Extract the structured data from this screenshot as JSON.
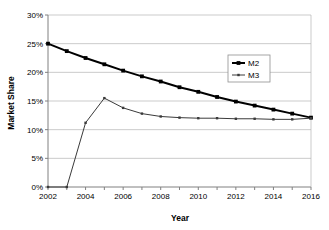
{
  "chart_data": {
    "type": "line",
    "title": "",
    "xlabel": "Year",
    "ylabel": "Market Share",
    "x": [
      2002,
      2003,
      2004,
      2005,
      2006,
      2007,
      2008,
      2009,
      2010,
      2011,
      2012,
      2013,
      2014,
      2015,
      2016
    ],
    "xlim": [
      2002,
      2016
    ],
    "ylim": [
      0,
      30
    ],
    "ytick_labels": [
      "0%",
      "5%",
      "10%",
      "15%",
      "20%",
      "25%",
      "30%"
    ],
    "ytick_values": [
      0,
      5,
      10,
      15,
      20,
      25,
      30
    ],
    "xtick_labels": [
      "2002",
      "2004",
      "2006",
      "2008",
      "2010",
      "2012",
      "2014",
      "2016"
    ],
    "xtick_values": [
      2002,
      2004,
      2006,
      2008,
      2010,
      2012,
      2014,
      2016
    ],
    "grid": "horizontal",
    "legend_position": "upper-right",
    "series": [
      {
        "name": "M2",
        "color": "#000000",
        "line_width": 2,
        "marker": "square",
        "values": [
          25.0,
          23.7,
          22.5,
          21.4,
          20.3,
          19.3,
          18.4,
          17.4,
          16.6,
          15.7,
          14.9,
          14.2,
          13.5,
          12.8,
          12.1
        ]
      },
      {
        "name": "M3",
        "color": "#3a3a3a",
        "line_width": 1,
        "marker": "dot",
        "values": [
          0.0,
          0.0,
          11.2,
          15.5,
          13.8,
          12.8,
          12.3,
          12.1,
          12.0,
          12.0,
          11.9,
          11.9,
          11.8,
          11.8,
          12.0
        ]
      }
    ]
  },
  "legend": {
    "items": [
      {
        "label": "M2"
      },
      {
        "label": "M3"
      }
    ]
  },
  "axis": {
    "x_title": "Year",
    "y_title": "Market Share"
  },
  "colors": {
    "series_m2": "#000000",
    "series_m3": "#3a3a3a",
    "grid": "#b4b4b4",
    "axis": "#808080",
    "background": "#ffffff",
    "legend_border": "#909090"
  }
}
